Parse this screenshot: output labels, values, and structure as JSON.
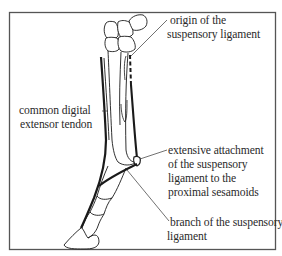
{
  "figure": {
    "colors": {
      "ink": "#1a1a1a",
      "frame": "#555555",
      "text": "#2a2a2a",
      "background": "#ffffff"
    }
  },
  "labels": {
    "origin": {
      "lines": [
        "origin of the",
        "suspensory ligament"
      ]
    },
    "extensor": {
      "lines": [
        "common digital",
        "extensor tendon"
      ]
    },
    "attachment": {
      "lines": [
        "extensive attachment",
        "of the suspensory",
        "ligament to the",
        "proximal sesamoids"
      ]
    },
    "branch": {
      "lines": [
        "branch of the suspensory",
        "ligament"
      ]
    }
  },
  "structures": [
    "carpal-bones",
    "cannon-bone",
    "splint-bone",
    "suspensory-ligament",
    "common-digital-extensor-tendon",
    "proximal-sesamoid",
    "pastern-bones",
    "hoof"
  ]
}
